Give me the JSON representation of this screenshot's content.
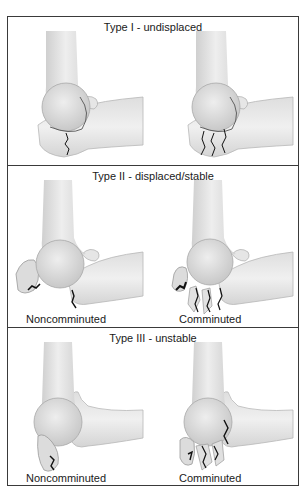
{
  "figure": {
    "border_color": "#3a3a3a",
    "bone_fill": "#e4e4e4",
    "bone_shadow": "#c9c9c9",
    "fracture_color": "#111111",
    "panels": [
      {
        "id": "type-1",
        "title": "Type I - undisplaced",
        "illustrations": [
          {
            "label": "",
            "fracture": "single-line"
          },
          {
            "label": "",
            "fracture": "multiple-lines"
          }
        ]
      },
      {
        "id": "type-2",
        "title": "Type II - displaced/stable",
        "illustrations": [
          {
            "label": "Noncomminuted",
            "fracture": "displaced-fragment"
          },
          {
            "label": "Comminuted",
            "fracture": "displaced-multiple-fragments"
          }
        ]
      },
      {
        "id": "type-3",
        "title": "Type III - unstable",
        "illustrations": [
          {
            "label": "Noncomminuted",
            "fracture": "unstable-fragment"
          },
          {
            "label": "Comminuted",
            "fracture": "unstable-multiple-fragments"
          }
        ]
      }
    ]
  }
}
